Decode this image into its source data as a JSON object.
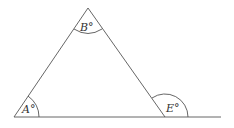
{
  "diagram": {
    "type": "triangle-exterior-angle",
    "vertices": {
      "A": {
        "x": 14,
        "y": 117
      },
      "B": {
        "x": 88,
        "y": 8
      },
      "C": {
        "x": 165,
        "y": 117
      }
    },
    "baseline_end": {
      "x": 221,
      "y": 117
    },
    "labels": {
      "A": "A°",
      "B": "B°",
      "E": "E°"
    },
    "colors": {
      "line": "#555555",
      "text": "#333333",
      "background": "#ffffff"
    }
  }
}
